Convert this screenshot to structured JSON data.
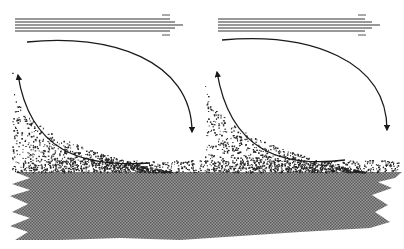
{
  "diagram": {
    "type": "flow-deposition-illustration",
    "background": "#ffffff",
    "colors": {
      "line": "#1a1a1a",
      "stripes": "#333333",
      "particles": "#222222",
      "ground_hatch": "#777777",
      "ground_base": "#8a8a8a"
    },
    "flow_arrows": [
      {
        "id": "left",
        "x1": 15,
        "x2": 183,
        "y": 25,
        "stripe_count": 5
      },
      {
        "id": "right",
        "x1": 218,
        "x2": 380,
        "y": 25,
        "stripe_count": 5
      }
    ],
    "eddies": [
      {
        "id": "left",
        "top_start_x": 27,
        "top_y": 42,
        "right_x": 192,
        "end_y": 132,
        "rise_start_x": 150,
        "rise_start_y": 163,
        "rise_end_x": 18,
        "rise_end_y": 75
      },
      {
        "id": "right",
        "top_start_x": 222,
        "top_y": 40,
        "right_x": 387,
        "end_y": 130,
        "rise_start_x": 345,
        "rise_start_y": 160,
        "rise_end_x": 217,
        "rise_end_y": 72
      }
    ],
    "ground": {
      "top_y": 172,
      "bottom_y": 238
    }
  }
}
